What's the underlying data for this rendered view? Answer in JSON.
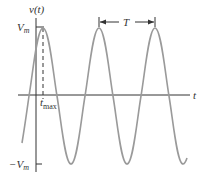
{
  "diagram": {
    "type": "sinusoid",
    "y_axis_label": "v(t)",
    "x_axis_label": "t",
    "amplitude_label_pos": "V",
    "amplitude_label_pos_sub": "m",
    "amplitude_label_neg": "−V",
    "amplitude_label_neg_sub": "m",
    "tmax_label": "t",
    "tmax_label_sub": "max",
    "period_label": "T",
    "colors": {
      "axis": "#333333",
      "curve": "#9a9a9a",
      "text": "#333333"
    }
  }
}
